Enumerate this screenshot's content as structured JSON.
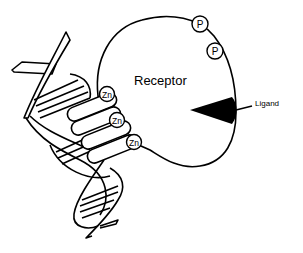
{
  "diagram": {
    "receptor_label": "Receptor",
    "ligand_label": "Ligand",
    "phosphate_labels": [
      "P",
      "P"
    ],
    "zinc_labels": [
      "Zn",
      "Zn",
      "Zn"
    ],
    "colors": {
      "stroke": "#000000",
      "fill": "#ffffff",
      "ligand": "#000000"
    }
  }
}
